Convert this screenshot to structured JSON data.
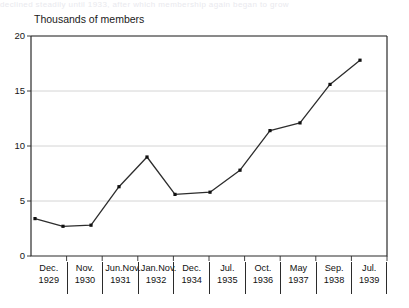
{
  "caption_ghost": "declined steadily until 1933, after which membership again began to grow",
  "axis_title": "Thousands of members",
  "y_ticks": [
    "0",
    "5",
    "10",
    "15",
    "20"
  ],
  "x_groups": [
    {
      "months": [
        "Dec."
      ],
      "year": "1929"
    },
    {
      "months": [
        "Nov."
      ],
      "year": "1930"
    },
    {
      "months": [
        "Jun.",
        "Nov."
      ],
      "year": "1931"
    },
    {
      "months": [
        "Jan.",
        "Nov."
      ],
      "year": "1932"
    },
    {
      "months": [
        "Dec."
      ],
      "year": "1934"
    },
    {
      "months": [
        "Jul."
      ],
      "year": "1935"
    },
    {
      "months": [
        "Oct."
      ],
      "year": "1936"
    },
    {
      "months": [
        "May"
      ],
      "year": "1937"
    },
    {
      "months": [
        "Sep."
      ],
      "year": "1938"
    },
    {
      "months": [
        "Jul."
      ],
      "year": "1939"
    }
  ],
  "colors": {
    "line": "#2d2d2d",
    "marker": "#111111",
    "axis": "#2b2b2b",
    "grid": "#c9c9c9",
    "text": "#111111"
  },
  "chart_data": {
    "type": "line",
    "title": "",
    "xlabel": "",
    "ylabel": "Thousands of members",
    "ylim": [
      0,
      20
    ],
    "yticks": [
      0,
      5,
      10,
      15,
      20
    ],
    "grid": "horizontal",
    "legend": "none",
    "markers": "square",
    "categories": [
      "Dec. 1929",
      "Nov. 1930",
      "Jun. 1931",
      "Nov. 1931",
      "Jan. 1932",
      "Nov. 1932",
      "Dec. 1934",
      "Jul. 1935",
      "Oct. 1936",
      "May 1937",
      "Sep. 1938",
      "Jul. 1939"
    ],
    "values": [
      3.4,
      2.7,
      2.8,
      6.3,
      9.0,
      5.6,
      5.8,
      7.8,
      11.4,
      12.1,
      15.6,
      17.8
    ],
    "series": [
      {
        "name": "Members",
        "values": [
          3.4,
          2.7,
          2.8,
          6.3,
          9.0,
          5.6,
          5.8,
          7.8,
          11.4,
          12.1,
          15.6,
          17.8
        ]
      }
    ]
  },
  "geometry": {
    "plot_left": 31,
    "plot_right": 387,
    "plot_top": 36,
    "plot_bottom": 256,
    "point_x": [
      35,
      63,
      91,
      119,
      147,
      175,
      210,
      240,
      270,
      300,
      330,
      360
    ]
  }
}
